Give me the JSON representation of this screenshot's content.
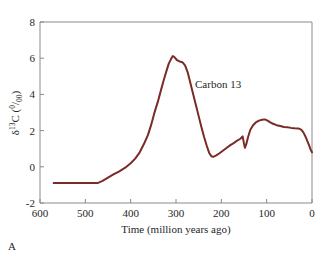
{
  "figure": {
    "panel_label": "A",
    "background_color": "#ffffff",
    "frame_color": "#8a8a8a"
  },
  "chart_data": {
    "type": "line",
    "title": "",
    "subtitle": "",
    "xlabel": "Time (million years ago)",
    "ylabel": "δ13C (0/00)",
    "ylabel_parts": {
      "delta": "δ",
      "superscript": "13",
      "element": "C",
      "open_paren": "(",
      "permil_numerator": "0",
      "permil_slash": "/",
      "permil_denominator": "00",
      "close_paren": ")"
    },
    "xlim": [
      600,
      0
    ],
    "ylim": [
      -2,
      8
    ],
    "x_inverted": true,
    "xticks": [
      600,
      500,
      400,
      300,
      200,
      100,
      0
    ],
    "xtick_labels": [
      "600",
      "500",
      "400",
      "300",
      "200",
      "100",
      "0"
    ],
    "yticks": [
      -2,
      0,
      2,
      4,
      6,
      8
    ],
    "ytick_labels": [
      "-2",
      "0",
      "2",
      "4",
      "6",
      "8"
    ],
    "grid": false,
    "legend_position": "none",
    "series": [
      {
        "name": "Carbon 13",
        "color": "#7b2b26",
        "line_width": 2,
        "annotation": {
          "text": "Carbon 13",
          "x": 258,
          "y": 4.35
        },
        "points": [
          [
            570,
            -0.9
          ],
          [
            540,
            -0.9
          ],
          [
            510,
            -0.9
          ],
          [
            490,
            -0.9
          ],
          [
            473,
            -0.9
          ],
          [
            462,
            -0.78
          ],
          [
            450,
            -0.6
          ],
          [
            438,
            -0.42
          ],
          [
            425,
            -0.25
          ],
          [
            412,
            -0.05
          ],
          [
            400,
            0.2
          ],
          [
            390,
            0.45
          ],
          [
            380,
            0.8
          ],
          [
            370,
            1.3
          ],
          [
            362,
            1.75
          ],
          [
            355,
            2.3
          ],
          [
            348,
            2.95
          ],
          [
            340,
            3.6
          ],
          [
            333,
            4.25
          ],
          [
            327,
            4.8
          ],
          [
            321,
            5.3
          ],
          [
            316,
            5.7
          ],
          [
            311,
            5.95
          ],
          [
            307,
            6.12
          ],
          [
            303,
            6.05
          ],
          [
            298,
            5.9
          ],
          [
            292,
            5.82
          ],
          [
            286,
            5.78
          ],
          [
            280,
            5.6
          ],
          [
            274,
            5.2
          ],
          [
            268,
            4.6
          ],
          [
            262,
            4.0
          ],
          [
            256,
            3.4
          ],
          [
            250,
            2.8
          ],
          [
            244,
            2.2
          ],
          [
            238,
            1.65
          ],
          [
            232,
            1.15
          ],
          [
            227,
            0.78
          ],
          [
            222,
            0.58
          ],
          [
            218,
            0.55
          ],
          [
            212,
            0.62
          ],
          [
            204,
            0.75
          ],
          [
            196,
            0.9
          ],
          [
            188,
            1.05
          ],
          [
            180,
            1.2
          ],
          [
            172,
            1.32
          ],
          [
            165,
            1.45
          ],
          [
            158,
            1.55
          ],
          [
            153,
            1.68
          ],
          [
            150,
            1.28
          ],
          [
            148,
            1.05
          ],
          [
            145,
            1.25
          ],
          [
            141,
            1.65
          ],
          [
            136,
            2.05
          ],
          [
            130,
            2.3
          ],
          [
            124,
            2.45
          ],
          [
            117,
            2.55
          ],
          [
            110,
            2.6
          ],
          [
            104,
            2.62
          ],
          [
            98,
            2.55
          ],
          [
            92,
            2.45
          ],
          [
            86,
            2.38
          ],
          [
            78,
            2.3
          ],
          [
            70,
            2.25
          ],
          [
            62,
            2.2
          ],
          [
            54,
            2.18
          ],
          [
            46,
            2.15
          ],
          [
            38,
            2.13
          ],
          [
            30,
            2.12
          ],
          [
            24,
            2.05
          ],
          [
            19,
            1.9
          ],
          [
            14,
            1.65
          ],
          [
            10,
            1.4
          ],
          [
            6,
            1.15
          ],
          [
            3,
            0.95
          ],
          [
            0,
            0.8
          ]
        ]
      }
    ]
  }
}
